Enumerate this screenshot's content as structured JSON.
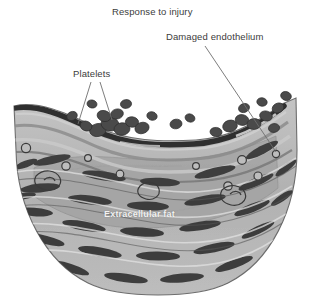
{
  "figure": {
    "type": "medical-illustration",
    "background_color": "#ffffff"
  },
  "labels": {
    "response": "Response to injury",
    "damaged_endothelium": "Damaged endothelium",
    "platelets": "Platelets",
    "extracellular_fat": "Extracellular fat"
  },
  "colors": {
    "text": "#3c3c3c",
    "caption_text": "#f2f2f2",
    "leader_line": "#6e6e6e",
    "platelet_dark": "#4a4a4a",
    "platelet_mid": "#5e5e5e",
    "wall_light": "#c8c8c8",
    "wall_mid": "#a8a8a8",
    "wall_band": "#8e8e8e",
    "cell_dark": "#3f3f3f",
    "fat_core": "#a6a6a6",
    "outline": "#2e2e2e"
  },
  "structures": {
    "platelet_clusters": 16,
    "smooth_muscle_cells": 42,
    "vacuoles": 11,
    "leader_lines": 3
  },
  "icons": {
    "platelet": "platelet-blob-icon",
    "muscle_cell": "spindle-cell-icon",
    "vacuole": "vacuole-circle-icon"
  }
}
